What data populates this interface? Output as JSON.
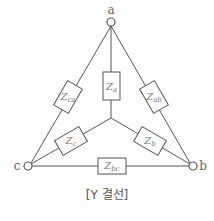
{
  "diagram": {
    "type": "circuit",
    "caption": "[Y 결선]",
    "nodes": {
      "a": {
        "label": "a"
      },
      "b": {
        "label": "b"
      },
      "c": {
        "label": "c"
      }
    },
    "impedances": {
      "za": {
        "main": "Z",
        "sub": "a"
      },
      "zb": {
        "main": "Z",
        "sub": "b"
      },
      "zc": {
        "main": "Z",
        "sub": "c"
      },
      "zab": {
        "main": "Z",
        "sub": "ab"
      },
      "zbc": {
        "main": "Z",
        "sub": "bc"
      },
      "zca": {
        "main": "Z",
        "sub": "ca"
      }
    },
    "colors": {
      "line": "#555555",
      "text": "#666666"
    }
  }
}
